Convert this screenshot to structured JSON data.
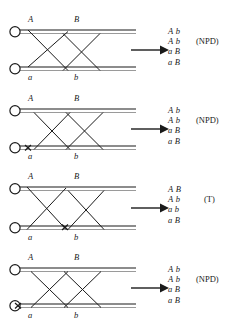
{
  "figure": {
    "type": "genetics-crossover-diagram",
    "background": "#ffffff",
    "ink": "#1a1a1a",
    "chromatid_gray": "#9a9a9a",
    "panel_count": 4,
    "arrow_glyph": "right-arrow"
  },
  "panels": [
    {
      "id": "panel-1",
      "top": 14,
      "labels": {
        "upper_left": "A",
        "upper_right": "B",
        "lower_left": "a",
        "lower_right": "b"
      },
      "chiasma_mark": false,
      "products": [
        {
          "left": "A",
          "right": "b"
        },
        {
          "left": "A",
          "right": "b"
        },
        {
          "left": "a",
          "right": "B"
        },
        {
          "left": "a",
          "right": "B"
        }
      ],
      "tetrad_type": "(NPD)",
      "tag_row": 1,
      "tag_offset": 28
    },
    {
      "id": "panel-2",
      "top": 93,
      "labels": {
        "upper_left": "A",
        "upper_right": "B",
        "lower_left": "a",
        "lower_right": "b"
      },
      "chiasma_mark": true,
      "chiasma_x": 20,
      "products": [
        {
          "left": "A",
          "right": "b"
        },
        {
          "left": "A",
          "right": "b"
        },
        {
          "left": "a",
          "right": "B"
        },
        {
          "left": "a",
          "right": "B"
        }
      ],
      "tetrad_type": "(NPD)",
      "tag_row": 1,
      "tag_offset": 28
    },
    {
      "id": "panel-3",
      "top": 172,
      "labels": {
        "upper_left": "A",
        "upper_right": "B",
        "lower_left": "a",
        "lower_right": "b"
      },
      "chiasma_mark": true,
      "chiasma_x": 57,
      "products": [
        {
          "left": "A",
          "right": "B"
        },
        {
          "left": "A",
          "right": "b"
        },
        {
          "left": "a",
          "right": "b"
        },
        {
          "left": "a",
          "right": "B"
        }
      ],
      "tetrad_type": "(T)",
      "tag_row": 1,
      "tag_offset": 36
    },
    {
      "id": "panel-4",
      "top": 254,
      "labels": {
        "upper_left": "A",
        "upper_right": "B",
        "lower_left": "a",
        "lower_right": "b"
      },
      "chiasma_mark": true,
      "chiasma_x": 10,
      "products": [
        {
          "left": "A",
          "right": "b"
        },
        {
          "left": "A",
          "right": "b"
        },
        {
          "left": "a",
          "right": "B"
        },
        {
          "left": "a",
          "right": "B"
        }
      ],
      "tetrad_type": "(NPD)",
      "tag_row": 1,
      "tag_offset": 28
    }
  ]
}
